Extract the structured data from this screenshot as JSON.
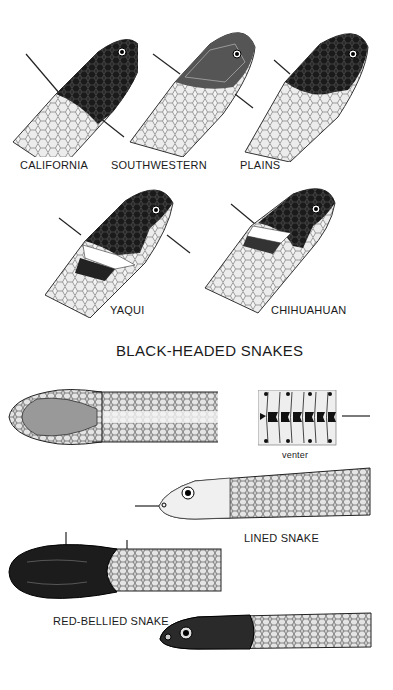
{
  "page": {
    "title": "BLACK-HEADED SNAKES",
    "background": "#ffffff",
    "ink_color": "#1a1a1a"
  },
  "black_headed_snakes": [
    {
      "label": "CALIFORNIA"
    },
    {
      "label": "SOUTHWESTERN"
    },
    {
      "label": "PLAINS"
    },
    {
      "label": "YAQUI"
    },
    {
      "label": "CHIHUAHUAN"
    }
  ],
  "lined_snake": {
    "label": "LINED SNAKE",
    "venter_label": "venter"
  },
  "red_bellied_snake": {
    "label": "RED-BELLIED SNAKE"
  }
}
